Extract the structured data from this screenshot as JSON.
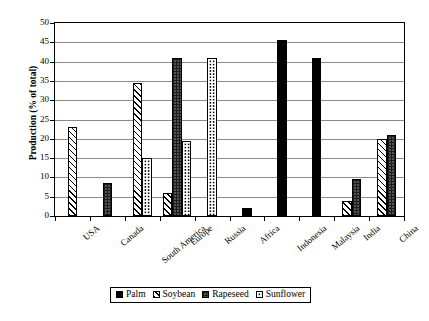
{
  "chart_data": {
    "type": "bar",
    "title": "",
    "xlabel": "",
    "ylabel": "Production (% of total)",
    "ylim": [
      0,
      50
    ],
    "ytick_step": 5,
    "yticks": [
      "50",
      "45",
      "40",
      "35",
      "30",
      "25",
      "20",
      "15",
      "10",
      "5",
      "0"
    ],
    "grid": true,
    "legend_position": "bottom",
    "categories": [
      "USA",
      "Canada",
      "South America",
      "Europe",
      "Russia",
      "Africa",
      "Indonesia",
      "Malaysia",
      "India",
      "China"
    ],
    "series": [
      {
        "name": "Palm",
        "pattern": "solid-black",
        "color": "#000000",
        "values": [
          0,
          0,
          0,
          0,
          0,
          2,
          45.5,
          41,
          0,
          0
        ]
      },
      {
        "name": "Soybean",
        "pattern": "diagonal-hatch",
        "color": "#ffffff",
        "values": [
          23,
          0,
          34.5,
          6,
          0,
          0,
          0,
          0,
          4,
          20
        ]
      },
      {
        "name": "Rapeseed",
        "pattern": "dark-dotted",
        "color": "#1b1b1b",
        "values": [
          0,
          8.5,
          0,
          41,
          0,
          0,
          0,
          0,
          9.5,
          21
        ]
      },
      {
        "name": "Sunflower",
        "pattern": "light-dotted",
        "color": "#ffffff",
        "values": [
          0,
          0,
          15,
          19.5,
          41,
          0,
          0,
          0,
          0,
          0
        ]
      }
    ]
  },
  "legend": {
    "items": [
      {
        "label": "Palm"
      },
      {
        "label": "Soybean"
      },
      {
        "label": "Rapeseed"
      },
      {
        "label": "Sunflower"
      }
    ]
  }
}
